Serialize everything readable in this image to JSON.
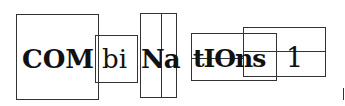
{
  "segments": [
    {
      "text": "COM",
      "weight": "bold"
    },
    {
      "text": "bi",
      "weight": "normal"
    },
    {
      "text": "Na",
      "n_weight": "bold"
    },
    {
      "text": "tIOns",
      "weight": "bold-mixed"
    },
    {
      "text": "1",
      "weight": "normal"
    }
  ],
  "colors": {
    "stroke": "#333333",
    "text": "#111111",
    "background": "#ffffff"
  }
}
